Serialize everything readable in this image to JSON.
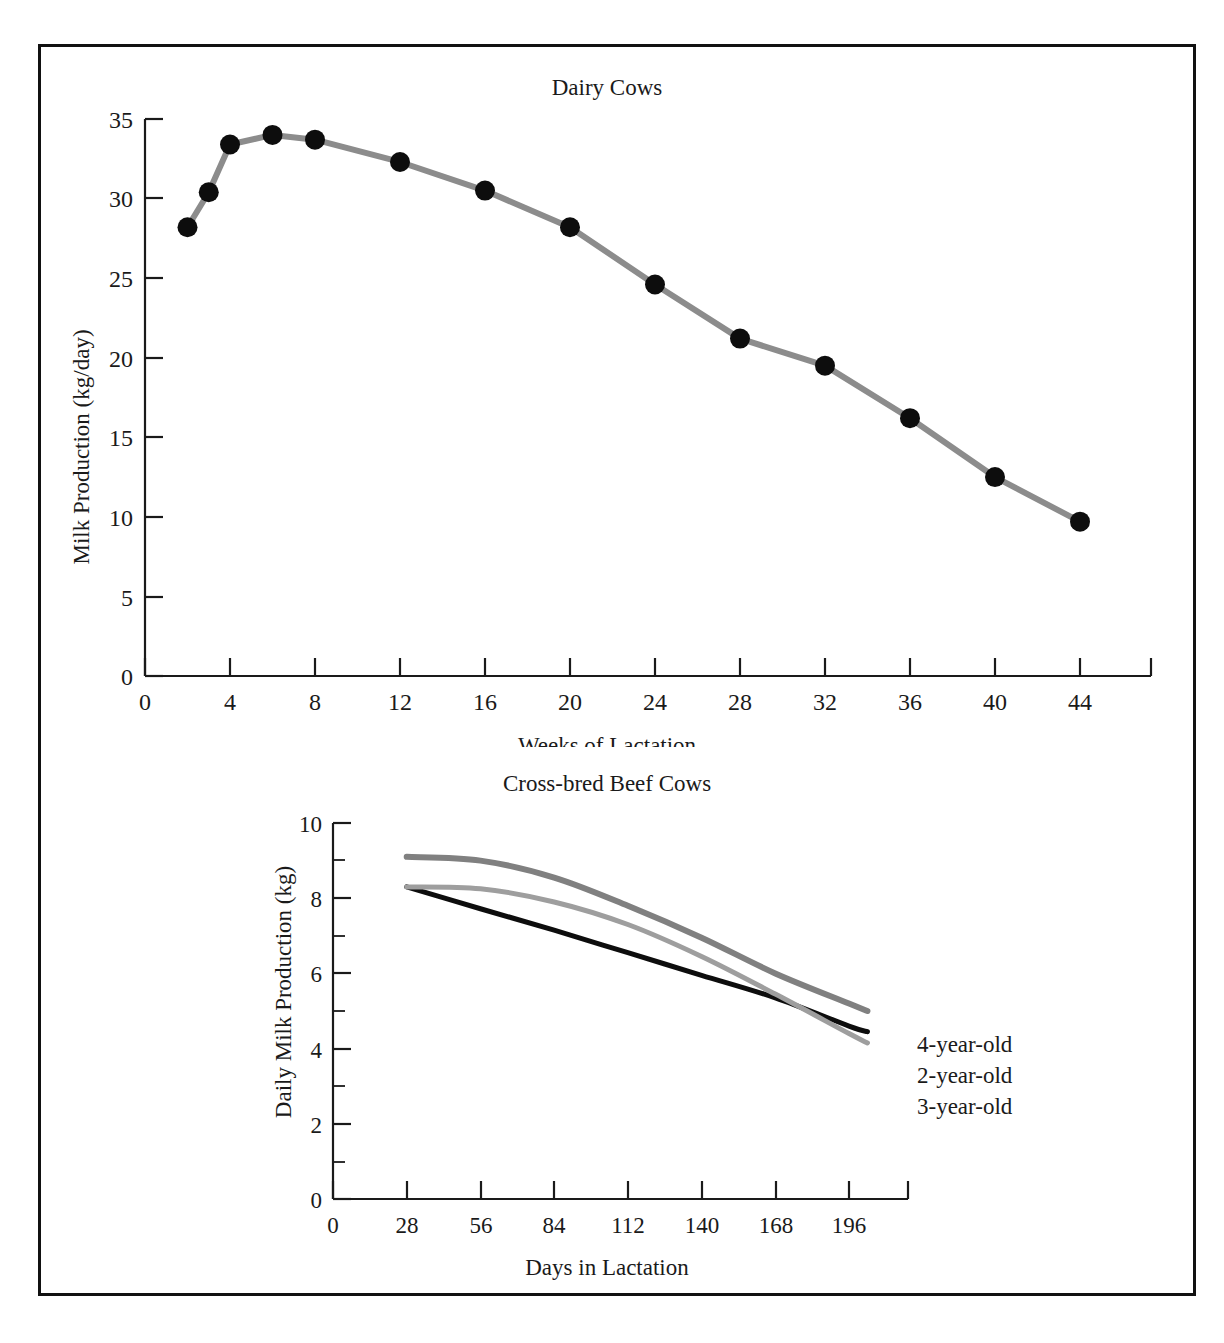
{
  "figure": {
    "border_color": "#111111",
    "background": "#ffffff"
  },
  "chart_data": [
    {
      "type": "line",
      "id": "dairy-cows",
      "title": "Dairy Cows",
      "xlabel": "Weeks of Lactation",
      "ylabel": "Milk Production (kg/day)",
      "xlim": [
        0,
        48
      ],
      "ylim": [
        0,
        35
      ],
      "xticks": [
        0,
        4,
        8,
        12,
        16,
        20,
        24,
        28,
        32,
        36,
        40,
        44
      ],
      "xtick_labels": [
        "0",
        "4",
        "8",
        "12",
        "16",
        "20",
        "24",
        "28",
        "32",
        "36",
        "40",
        "44"
      ],
      "yticks": [
        0,
        5,
        10,
        15,
        20,
        25,
        30,
        35
      ],
      "ytick_labels": [
        "0",
        "5",
        "10",
        "15",
        "20",
        "25",
        "30",
        "35"
      ],
      "grid": false,
      "legend": "none",
      "marker": "filled-circle",
      "marker_color": "#0d0d0d",
      "line_color": "#8c8c8c",
      "x": [
        2,
        3,
        4,
        6,
        8,
        12,
        16,
        20,
        24,
        28,
        32,
        36,
        40,
        44
      ],
      "values": [
        28.2,
        30.4,
        33.4,
        34.0,
        33.7,
        32.3,
        30.5,
        28.2,
        24.6,
        21.2,
        19.5,
        16.2,
        12.5,
        9.7
      ],
      "series": [
        {
          "name": "Milk Production",
          "values": [
            28.2,
            30.4,
            33.4,
            34.0,
            33.7,
            32.3,
            30.5,
            28.2,
            24.6,
            21.2,
            19.5,
            16.2,
            12.5,
            9.7
          ]
        }
      ]
    },
    {
      "type": "line",
      "id": "cross-bred-beef-cows",
      "title": "Cross-bred Beef Cows",
      "xlabel": "Days in Lactation",
      "ylabel": "Daily Milk Production (kg)",
      "xlim": [
        0,
        210
      ],
      "ylim": [
        0,
        10
      ],
      "xticks": [
        0,
        28,
        56,
        84,
        112,
        140,
        168,
        196
      ],
      "xtick_labels": [
        "0",
        "28",
        "56",
        "84",
        "112",
        "140",
        "168",
        "196"
      ],
      "yticks": [
        0,
        2,
        4,
        6,
        8,
        10
      ],
      "ytick_labels": [
        "0",
        "2",
        "4",
        "6",
        "8",
        "10"
      ],
      "yticks_minor": [
        1,
        3,
        5,
        7,
        9
      ],
      "grid": false,
      "legend": "right-inline",
      "x": [
        28,
        56,
        84,
        112,
        140,
        168,
        196,
        203
      ],
      "series": [
        {
          "name": "4-year-old",
          "color": "#808080",
          "width": 6,
          "values": [
            9.1,
            9.0,
            8.55,
            7.8,
            6.95,
            6.0,
            5.2,
            5.0
          ]
        },
        {
          "name": "2-year-old",
          "color": "#0d0d0d",
          "width": 5,
          "values": [
            8.3,
            7.72,
            7.15,
            6.55,
            5.95,
            5.35,
            4.6,
            4.45
          ]
        },
        {
          "name": "3-year-old",
          "color": "#9e9e9e",
          "width": 5,
          "values": [
            8.3,
            8.25,
            7.9,
            7.3,
            6.45,
            5.45,
            4.4,
            4.15
          ]
        }
      ]
    }
  ]
}
